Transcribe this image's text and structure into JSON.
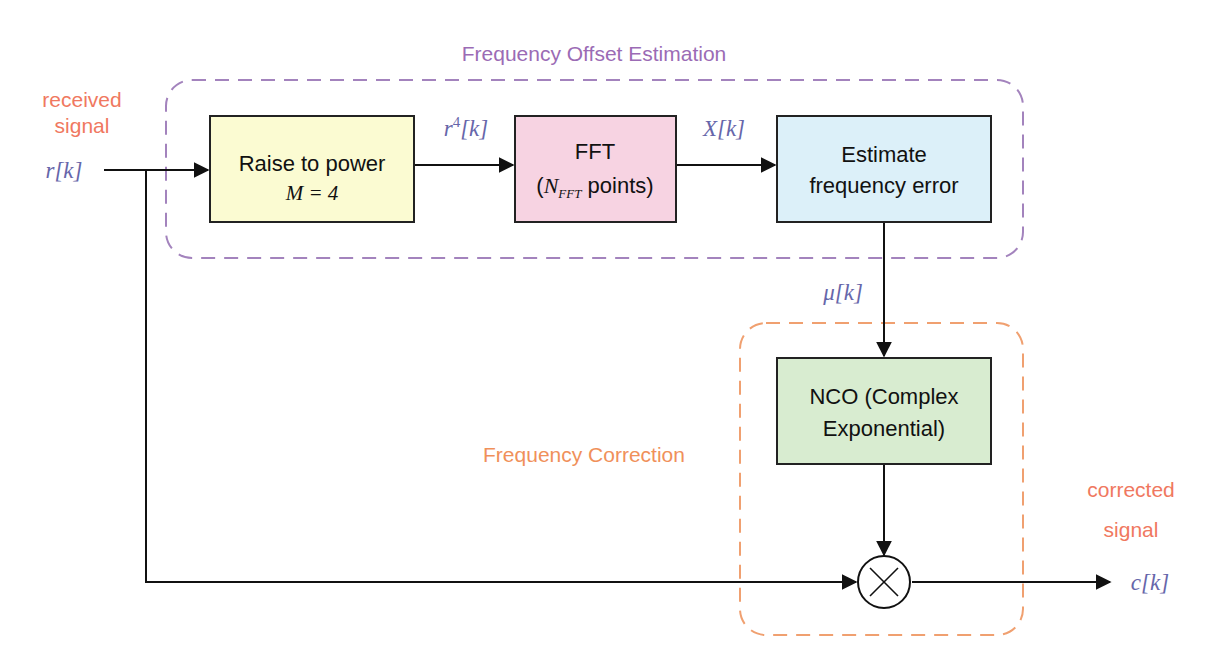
{
  "groups": {
    "estimation": {
      "title": "Frequency Offset Estimation",
      "color": "#9b6bb5"
    },
    "correction": {
      "title": "Frequency Correction",
      "color": "#f0905a"
    }
  },
  "io": {
    "input_caption_line1": "received",
    "input_caption_line2": "signal",
    "input_symbol": "r[k]",
    "output_caption_line1": "corrected",
    "output_caption_line2": "signal",
    "output_symbol": "c[k]",
    "caption_color": "#f07860",
    "symbol_color": "#6666aa"
  },
  "blocks": {
    "raise_power": {
      "line1": "Raise to power",
      "line2": "M = 4",
      "fill": "#fbfbd2"
    },
    "fft": {
      "line1": "FFT",
      "line2_pre": "(",
      "line2_sym": "N",
      "line2_sub": "FFT",
      "line2_post": " points)",
      "fill": "#f7d3e2"
    },
    "estimate": {
      "line1": "Estimate",
      "line2": "frequency error",
      "fill": "#dcf0f9"
    },
    "nco": {
      "line1": "NCO (Complex",
      "line2": "Exponential)",
      "fill": "#d8ecd0"
    },
    "mixer": {
      "symbol": "×"
    }
  },
  "signals": {
    "r4": {
      "base": "r",
      "sup": "4",
      "rest": "[k]"
    },
    "X": "X[k]",
    "mu": "μ[k]"
  }
}
